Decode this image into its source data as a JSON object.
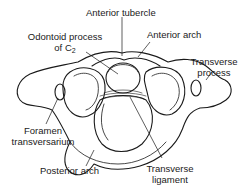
{
  "diagram": {
    "labels": {
      "anterior_tubercle": "Anterior tubercle",
      "odontoid_line1": "Odontoid process",
      "odontoid_line2": "of C",
      "odontoid_sub": "2",
      "anterior_arch": "Anterior arch",
      "transverse_process_line1": "Transverse",
      "transverse_process_line2": "process",
      "foramen_line1": "Foramen",
      "foramen_line2": "transversarium",
      "posterior_arch": "Posterior arch",
      "transverse_ligament_line1": "Transverse",
      "transverse_ligament_line2": "ligament"
    },
    "colors": {
      "line": "#1a1a1a",
      "background": "#ffffff"
    }
  }
}
